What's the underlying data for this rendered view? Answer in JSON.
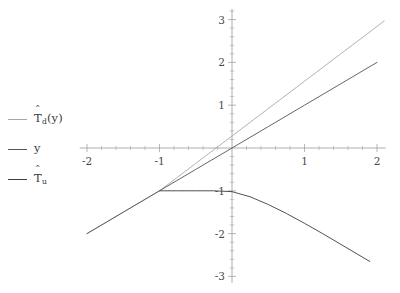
{
  "chart_data": {
    "type": "line",
    "title": "",
    "subtitle": "",
    "xlabel": "",
    "ylabel": "",
    "xlim": [
      -2.1,
      2.12
    ],
    "ylim": [
      -3.15,
      3.25
    ],
    "xticks": [
      -2,
      -1,
      1,
      2
    ],
    "xticklabels": [
      "-2",
      "-1",
      "1",
      "2"
    ],
    "yticks": [
      3,
      2,
      1,
      -1,
      -2,
      -3
    ],
    "yticklabels": [
      "3",
      "2",
      "1",
      "-1",
      "-2",
      "-3"
    ],
    "minor_tick_step": 0.2,
    "grid": false,
    "axis_style": "centered-spines-at-origin",
    "legend": {
      "position": "outside-left",
      "entries": [
        {
          "id": "T_d",
          "label_plain": "T̂_d(y)",
          "base": "T",
          "hat": "ˆ",
          "sub": "d",
          "suffix": "(y)",
          "color": "#a8a8a8"
        },
        {
          "id": "y",
          "label_plain": "y",
          "base": "y",
          "hat": "",
          "sub": "",
          "suffix": "",
          "color": "#545454"
        },
        {
          "id": "T_u",
          "label_plain": "T̂_u",
          "base": "T",
          "hat": "ˆ",
          "sub": "u",
          "suffix": "",
          "color": "#3d3d3d"
        }
      ]
    },
    "series": [
      {
        "name": "T̂_d(y)",
        "color": "#a8a8a8",
        "linewidth": 0.9,
        "x": [
          -2.0,
          -1.75,
          -1.5,
          -1.25,
          -1.0,
          -0.75,
          -0.5,
          -0.25,
          0.0,
          0.25,
          0.5,
          0.75,
          1.0,
          1.25,
          1.5,
          1.75,
          2.0,
          2.1
        ],
        "y": [
          -2.0,
          -1.75,
          -1.5,
          -1.25,
          -1.0,
          -0.68,
          -0.36,
          -0.04,
          0.28,
          0.6,
          0.92,
          1.24,
          1.56,
          1.88,
          2.2,
          2.52,
          2.84,
          2.97
        ]
      },
      {
        "name": "y",
        "color": "#545454",
        "linewidth": 0.9,
        "x": [
          -2.0,
          -1.5,
          -1.0,
          -0.5,
          0.0,
          0.5,
          1.0,
          1.5,
          2.0
        ],
        "y": [
          -2.0,
          -1.5,
          -1.0,
          -0.5,
          0.0,
          0.5,
          1.0,
          1.5,
          2.0
        ]
      },
      {
        "name": "T̂_u",
        "color": "#3d3d3d",
        "linewidth": 0.9,
        "x": [
          -1.0,
          -0.75,
          -0.5,
          -0.25,
          0.0,
          0.25,
          0.5,
          0.75,
          1.0,
          1.25,
          1.5,
          1.75,
          1.9
        ],
        "y": [
          -1.0,
          -1.0,
          -1.0,
          -1.0,
          -1.02,
          -1.14,
          -1.32,
          -1.53,
          -1.76,
          -2.0,
          -2.25,
          -2.5,
          -2.65
        ]
      }
    ],
    "annotations": [
      {
        "kind": "kink-point",
        "x": -1,
        "y": -1,
        "note": "curves meet at (-1, -1)"
      }
    ],
    "colors": {
      "axis": "#9a9a9a",
      "tick_label": "#4a4a4a",
      "background": "#ffffff"
    }
  }
}
